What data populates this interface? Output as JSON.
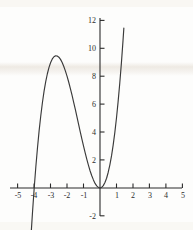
{
  "figure": {
    "kind": "cartesian-plot",
    "background_color": "#fdfdfc",
    "curve_color": "#3a3a3a",
    "axis_color": "#2b2b2b"
  },
  "chart_data": {
    "type": "line",
    "title": "",
    "subtitle": "",
    "xlabel": "",
    "ylabel": "",
    "xlim": [
      -5.4,
      5.4
    ],
    "ylim": [
      -2.6,
      12.6
    ],
    "grid": false,
    "legend": null,
    "annotations": [],
    "function": "y = x^2 (x + 4)",
    "x_ticks": [
      -5,
      -4,
      -3,
      -2,
      -1,
      1,
      2,
      3,
      4,
      5
    ],
    "x_tick_labels": [
      "-5",
      "-4",
      "-3",
      "-2",
      "-1",
      "1",
      "2",
      "3",
      "4",
      "5"
    ],
    "y_ticks": [
      -2,
      2,
      4,
      6,
      8,
      10,
      12
    ],
    "y_tick_labels": [
      "-2",
      "2",
      "4",
      "6",
      "8",
      "10",
      "12"
    ],
    "series": [
      {
        "name": "cubic",
        "x": [
          -4.35,
          -4.2,
          -4.1,
          -4.0,
          -3.9,
          -3.8,
          -3.7,
          -3.6,
          -3.5,
          -3.4,
          -3.3,
          -3.2,
          -3.1,
          -3.0,
          -2.9,
          -2.8,
          -2.7,
          -2.6,
          -2.5,
          -2.4,
          -2.3,
          -2.2,
          -2.1,
          -2.0,
          -1.9,
          -1.8,
          -1.7,
          -1.6,
          -1.5,
          -1.4,
          -1.3,
          -1.2,
          -1.1,
          -1.0,
          -0.9,
          -0.8,
          -0.7,
          -0.6,
          -0.5,
          -0.4,
          -0.3,
          -0.2,
          -0.1,
          0.0,
          0.1,
          0.2,
          0.3,
          0.4,
          0.5,
          0.6,
          0.7,
          0.8,
          0.9,
          1.0,
          1.1,
          1.2,
          1.3,
          1.4,
          1.45
        ],
        "y": [
          -6.62,
          -3.53,
          -1.68,
          0.0,
          1.52,
          2.89,
          4.11,
          5.18,
          6.13,
          6.94,
          7.62,
          8.19,
          8.65,
          9.0,
          9.25,
          9.41,
          9.48,
          9.46,
          9.38,
          9.22,
          8.99,
          8.71,
          8.38,
          8.0,
          7.58,
          7.13,
          6.65,
          6.14,
          5.63,
          5.1,
          4.56,
          4.03,
          3.51,
          3.0,
          2.51,
          2.05,
          1.62,
          1.22,
          0.88,
          0.58,
          0.33,
          0.15,
          0.04,
          0.0,
          0.04,
          0.17,
          0.39,
          0.7,
          1.13,
          1.66,
          2.3,
          3.07,
          3.97,
          5.0,
          6.17,
          7.49,
          8.95,
          10.58,
          11.46
        ],
        "roots": [
          -4,
          0
        ],
        "local_max": [
          -2.67,
          9.48
        ],
        "local_min": [
          0,
          0
        ]
      }
    ]
  },
  "axes": {
    "x_axis_label_values": [
      "-5",
      "-4",
      "-3",
      "-2",
      "-1",
      "1",
      "2",
      "3",
      "4",
      "5"
    ],
    "y_axis_label_values": [
      "12",
      "10",
      "8",
      "6",
      "4",
      "2",
      "-2"
    ]
  }
}
